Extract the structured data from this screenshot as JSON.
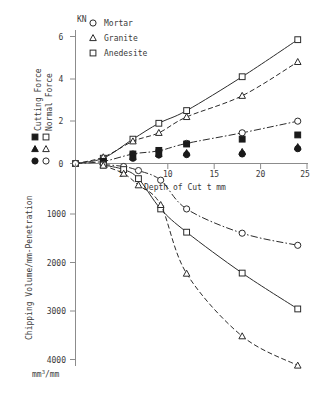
{
  "chart_data": {
    "type": "line",
    "title": "",
    "panels": [
      {
        "name": "upper",
        "ylabel_unit": "KN",
        "ylabel_key_left": "Cutting Force",
        "ylabel_key_right": "Normal Force",
        "xlabel": "Depth of Cut t mm",
        "xlim": [
          0,
          25
        ],
        "ylim": [
          0,
          6.5
        ],
        "xticks": [
          5,
          10,
          15,
          20,
          25
        ],
        "yticks": [
          0,
          2,
          4,
          6
        ],
        "grid": false,
        "legend_position": "top-left",
        "series": [
          {
            "name": "Anedesite Normal Force",
            "material": "Anedesite",
            "force": "Normal Force",
            "marker": "square-open",
            "linestyle": "solid",
            "x": [
              0,
              3,
              6.2,
              9,
              12,
              18,
              24
            ],
            "y": [
              0,
              0.25,
              1.15,
              1.9,
              2.5,
              4.1,
              5.85
            ]
          },
          {
            "name": "Granite Normal Force",
            "material": "Granite",
            "force": "Normal Force",
            "marker": "triangle-open",
            "linestyle": "dashed",
            "x": [
              0,
              3,
              6.2,
              9,
              12,
              18,
              24
            ],
            "y": [
              0,
              0.3,
              1.05,
              1.45,
              2.2,
              3.2,
              4.8
            ]
          },
          {
            "name": "Mortar Normal Force",
            "material": "Mortar",
            "force": "Normal Force",
            "marker": "circle-open",
            "linestyle": "dashdot",
            "x": [
              0,
              3,
              6.2,
              9,
              12,
              18,
              24
            ],
            "y": [
              0,
              0.1,
              0.45,
              0.6,
              0.95,
              1.45,
              2.0
            ]
          },
          {
            "name": "Anedesite Cutting Force",
            "material": "Anedesite",
            "force": "Cutting Force",
            "marker": "square-filled",
            "linestyle": "none",
            "x": [
              3,
              6.2,
              9,
              12,
              18,
              24
            ],
            "y": [
              0.1,
              0.45,
              0.62,
              0.92,
              1.15,
              1.35
            ]
          },
          {
            "name": "Granite Cutting Force",
            "material": "Granite",
            "force": "Cutting Force",
            "marker": "triangle-filled",
            "linestyle": "none",
            "x": [
              3,
              6.2,
              9,
              12,
              18,
              24
            ],
            "y": [
              0.07,
              0.3,
              0.45,
              0.5,
              0.55,
              0.78
            ]
          },
          {
            "name": "Mortar Cutting Force",
            "material": "Mortar",
            "force": "Cutting Force",
            "marker": "circle-filled",
            "linestyle": "none",
            "x": [
              3,
              6.2,
              9,
              12,
              18,
              24
            ],
            "y": [
              0.05,
              0.25,
              0.4,
              0.42,
              0.45,
              0.7
            ]
          }
        ]
      },
      {
        "name": "lower",
        "ylabel": "Chipping Volume/mm-Penetration",
        "ylabel_unit": "mm3/mm",
        "ylim": [
          0,
          4400
        ],
        "yticks": [
          1000,
          2000,
          3000,
          4000
        ],
        "xlim": [
          0,
          25
        ],
        "grid": false,
        "series": [
          {
            "name": "Mortar Chipping Volume",
            "material": "Mortar",
            "marker": "circle-open",
            "linestyle": "dashdot",
            "x": [
              3,
              5.2,
              6.8,
              9.2,
              12,
              18,
              24
            ],
            "y": [
              20,
              60,
              140,
              330,
              900,
              1380,
              1620
            ]
          },
          {
            "name": "Anedesite Chipping Volume",
            "material": "Anedesite",
            "marker": "square-open",
            "linestyle": "solid",
            "x": [
              3,
              5.2,
              6.8,
              9.2,
              12,
              18,
              24
            ],
            "y": [
              30,
              120,
              300,
              900,
              1360,
              2170,
              2880
            ]
          },
          {
            "name": "Granite Chipping Volume",
            "material": "Granite",
            "marker": "triangle-open",
            "linestyle": "dashed",
            "x": [
              3,
              5.2,
              6.8,
              9.2,
              12,
              18,
              24
            ],
            "y": [
              40,
              200,
              430,
              820,
              2180,
              3420,
              4000
            ]
          }
        ]
      }
    ]
  },
  "legend": {
    "items": [
      {
        "marker": "circle-open",
        "label": "Mortar"
      },
      {
        "marker": "triangle-open",
        "label": "Granite"
      },
      {
        "marker": "square-open",
        "label": "Anedesite"
      }
    ]
  },
  "force_key": {
    "cutting_label": "Cutting Force",
    "normal_label": "Normal Force",
    "cutting_markers": [
      "square-filled",
      "triangle-filled",
      "circle-filled"
    ],
    "normal_markers": [
      "square-open",
      "triangle-open",
      "circle-open"
    ]
  },
  "axes": {
    "upper_unit": "KN",
    "upper_yticks": [
      "6",
      "4",
      "2",
      "0"
    ],
    "xlabel": "Depth of Cut t mm",
    "xticks": [
      "5",
      "10",
      "15",
      "20",
      "25"
    ],
    "lower_ylabel": "Chipping Volume/mm-Penetration",
    "lower_yticks": [
      "1000",
      "2000",
      "3000",
      "4000"
    ],
    "lower_unit_prefix": "mm",
    "lower_unit_sup": "3",
    "lower_unit_suffix": "/mm"
  },
  "colors": {
    "ink": "#2b2b2b",
    "axis": "#8c8c8c",
    "background": "#ffffff"
  }
}
